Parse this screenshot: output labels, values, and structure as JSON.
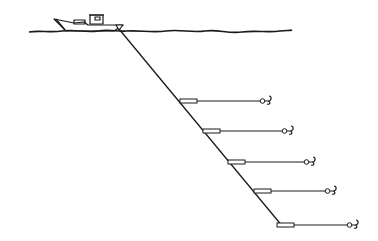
{
  "diagram": {
    "type": "line-drawing",
    "stroke_color": "#1a1a1a",
    "background_color": "#ffffff",
    "boat": {
      "x": 55,
      "y": 12
    },
    "water_line": {
      "x_start": 29,
      "x_end": 292,
      "y": 28
    },
    "main_line": {
      "x1": 119,
      "y1": 28,
      "x2": 283,
      "y2": 227
    },
    "branches": [
      {
        "y": 101,
        "x_start": 180,
        "x_end": 268
      },
      {
        "y": 131,
        "x_start": 203,
        "x_end": 290
      },
      {
        "y": 162,
        "x_start": 228,
        "x_end": 312
      },
      {
        "y": 191,
        "x_start": 254,
        "x_end": 333
      },
      {
        "y": 225,
        "x_start": 277,
        "x_end": 355
      }
    ]
  }
}
